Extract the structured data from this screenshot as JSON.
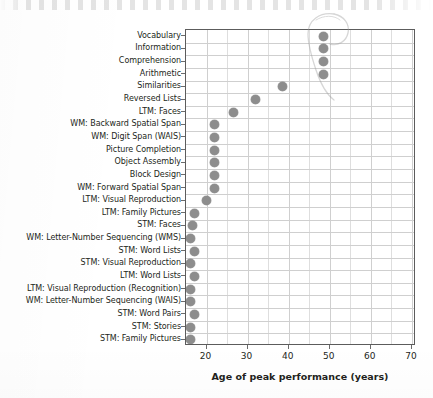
{
  "chart_data": {
    "type": "scatter",
    "title": "",
    "xlabel": "Age of peak performance (years)",
    "ylabel": "",
    "xlim": [
      15,
      71
    ],
    "ylim_categories": 23,
    "grid": true,
    "legend": "none",
    "orientation": "horizontal",
    "x_ticks": [
      20,
      30,
      40,
      50,
      60,
      70
    ],
    "x_tick_labels": [
      "20",
      "30",
      "40",
      "50",
      "60",
      "70"
    ],
    "categories": [
      "Vocabulary",
      "Information",
      "Comprehension",
      "Arithmetic",
      "Similarities",
      "Reversed Lists",
      "LTM: Faces",
      "WM: Backward Spatial Span",
      "WM: Digit Span (WAIS)",
      "Picture Completion",
      "Object Assembly",
      "Block Design",
      "WM: Forward Spatial Span",
      "LTM: Visual Reproduction",
      "LTM: Family Pictures",
      "STM: Faces",
      "WM: Letter-Number Sequencing (WMS)",
      "STM: Word Lists",
      "STM: Visual Reproduction",
      "LTM: Word Lists",
      "LTM: Visual Reproduction (Recognition)",
      "WM: Letter-Number Sequencing (WAIS)",
      "STM: Word Pairs",
      "STM: Stories",
      "STM: Family Pictures"
    ],
    "values": [
      48.5,
      48.5,
      48.5,
      48.5,
      38.5,
      32.0,
      26.5,
      22.0,
      22.0,
      22.0,
      22.0,
      22.0,
      22.0,
      20.0,
      17.0,
      16.5,
      16.0,
      17.0,
      16.0,
      17.0,
      16.0,
      16.0,
      17.0,
      16.0,
      16.0
    ],
    "annotations": [
      {
        "name": "pencil-loop",
        "text": "",
        "description": "faint hand-drawn pencil loop encircling the four topmost data points"
      }
    ],
    "marker_color": "#8d8d8d",
    "grid_color": "#cfcfcf",
    "axis_color": "#5c5c5c",
    "text_color": "#231f20"
  },
  "axis": {
    "x_title": "Age of peak performance (years)"
  }
}
